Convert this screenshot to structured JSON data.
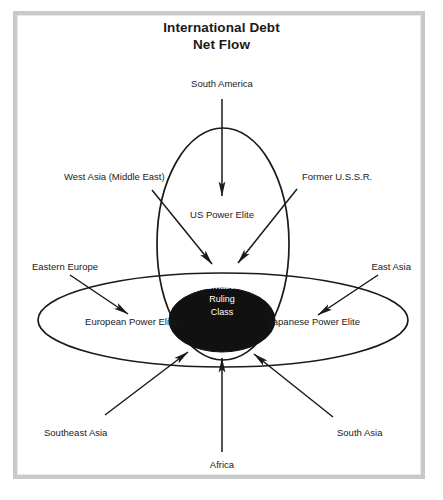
{
  "figure": {
    "title_line_1": "International Debt",
    "title_line_2": "Net Flow",
    "type": "venn-flow-diagram",
    "stroke_color": "#1a1a1a",
    "fill_color": "#111111",
    "frame_color": "#c9c9c9",
    "background": "#ffffff"
  },
  "core": {
    "line_1": "International",
    "line_2": "Ruling",
    "line_3": "Class"
  },
  "sets": {
    "us": "US Power Elite",
    "european": "European Power Elite",
    "japanese": "Japanese Power Elite"
  },
  "sources": {
    "south_america": "South America",
    "west_asia": "West Asia (Middle East)",
    "former_ussr": "Former U.S.S.R.",
    "eastern_europe": "Eastern Europe",
    "east_asia": "East Asia",
    "southeast_asia": "Southeast Asia",
    "south_asia": "South Asia",
    "africa": "Africa"
  }
}
